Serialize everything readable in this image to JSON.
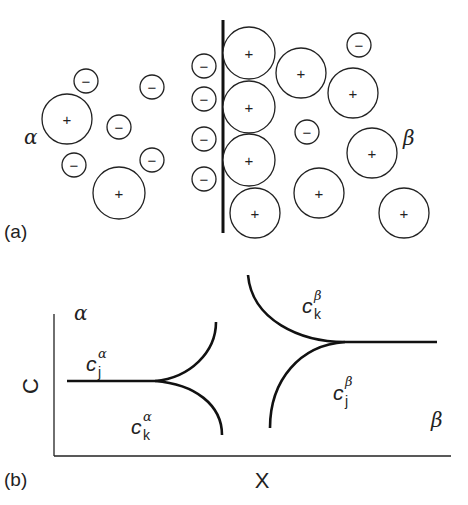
{
  "panel_a": {
    "label": "(a)",
    "phase_left": "α",
    "phase_right": "β",
    "interface": {
      "x": 223,
      "y1": 20,
      "y2": 233
    },
    "ions": [
      {
        "cx": 67,
        "cy": 119,
        "r": 25,
        "charge": "+"
      },
      {
        "cx": 119,
        "cy": 193,
        "r": 26,
        "charge": "+"
      },
      {
        "cx": 86,
        "cy": 81,
        "r": 12,
        "charge": "−"
      },
      {
        "cx": 152,
        "cy": 87,
        "r": 12,
        "charge": "−"
      },
      {
        "cx": 119,
        "cy": 127,
        "r": 12,
        "charge": "−"
      },
      {
        "cx": 74,
        "cy": 165,
        "r": 12,
        "charge": "−"
      },
      {
        "cx": 152,
        "cy": 160,
        "r": 12,
        "charge": "−"
      },
      {
        "cx": 204,
        "cy": 66,
        "r": 12,
        "charge": "−"
      },
      {
        "cx": 204,
        "cy": 99,
        "r": 12,
        "charge": "−"
      },
      {
        "cx": 204,
        "cy": 139,
        "r": 12,
        "charge": "−"
      },
      {
        "cx": 204,
        "cy": 179,
        "r": 12,
        "charge": "−"
      },
      {
        "cx": 249,
        "cy": 53,
        "r": 26,
        "charge": "+"
      },
      {
        "cx": 249,
        "cy": 107,
        "r": 26,
        "charge": "+"
      },
      {
        "cx": 249,
        "cy": 160,
        "r": 26,
        "charge": "+"
      },
      {
        "cx": 255,
        "cy": 213,
        "r": 25,
        "charge": "+"
      },
      {
        "cx": 301,
        "cy": 73,
        "r": 25,
        "charge": "+"
      },
      {
        "cx": 353,
        "cy": 93,
        "r": 25,
        "charge": "+"
      },
      {
        "cx": 372,
        "cy": 153,
        "r": 25,
        "charge": "+"
      },
      {
        "cx": 319,
        "cy": 193,
        "r": 25,
        "charge": "+"
      },
      {
        "cx": 404,
        "cy": 213,
        "r": 25,
        "charge": "+"
      },
      {
        "cx": 359,
        "cy": 45,
        "r": 12,
        "charge": "−"
      },
      {
        "cx": 307,
        "cy": 132,
        "r": 12,
        "charge": "−"
      }
    ]
  },
  "panel_b": {
    "label": "(b)",
    "y_axis_label": "C",
    "x_axis_label": "X",
    "phase_left": "α",
    "phase_right": "β",
    "curve_labels": {
      "cj_alpha": {
        "base": "c",
        "sub": "j",
        "sup": "α"
      },
      "ck_alpha": {
        "base": "c",
        "sub": "k",
        "sup": "α"
      },
      "ck_beta": {
        "base": "c",
        "sub": "k",
        "sup": "β"
      },
      "cj_beta": {
        "base": "c",
        "sub": "j",
        "sup": "β"
      }
    }
  }
}
